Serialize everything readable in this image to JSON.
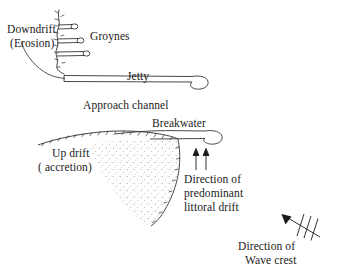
{
  "figure": {
    "background_color": "#ffffff",
    "line_color": "#2b2b2b",
    "stipple_color": "#9a9a9a"
  },
  "labels": {
    "downdrift_line1": "Downdrift",
    "downdrift_line2": "(Erosion)",
    "groynes": "Groynes",
    "jetty": "Jetty",
    "approach_channel": "Approach channel",
    "breakwater": "Breakwater",
    "updrift_line1": "Up drift",
    "updrift_line2": "( accretion)",
    "littoral_line1": "Direction of",
    "littoral_line2": "predominant",
    "littoral_line3": "littoral drift",
    "wave_line1": "Direction of",
    "wave_line2": "Wave crest"
  },
  "features": {
    "groyne_count": 3,
    "littoral_arrow_count": 2,
    "wave_crest_hatch_count": 3,
    "jetty_label_position": "above-jetty-bar",
    "accretion_fill": "stippled-sediment"
  }
}
